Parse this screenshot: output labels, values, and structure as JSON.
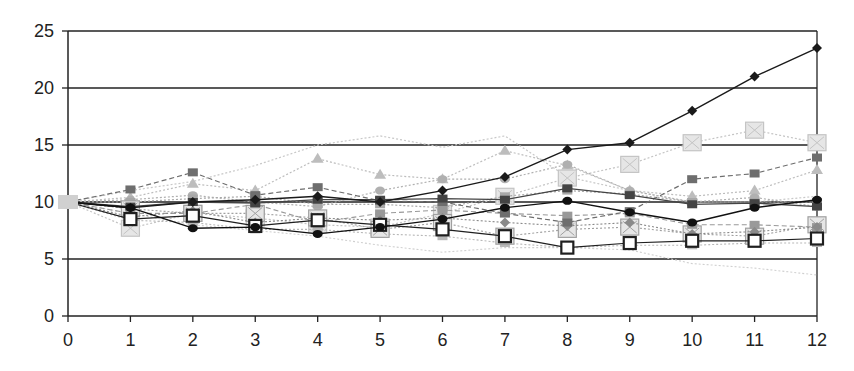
{
  "chart_data": {
    "type": "line",
    "title": "",
    "xlabel": "",
    "ylabel": "",
    "x": [
      0,
      1,
      2,
      3,
      4,
      5,
      6,
      7,
      8,
      9,
      10,
      11,
      12
    ],
    "xlim": [
      0,
      12
    ],
    "ylim": [
      0,
      25
    ],
    "yticks": [
      0,
      5,
      10,
      15,
      20,
      25
    ],
    "xticks": [
      0,
      1,
      2,
      3,
      4,
      5,
      6,
      7,
      8,
      9,
      10,
      11,
      12
    ],
    "grid": {
      "horizontal": true,
      "vertical": false
    },
    "legend": null,
    "series": [
      {
        "name": "series-1",
        "marker": "diamond",
        "color": "#1a1a1a",
        "dash": "solid",
        "width": 1.4,
        "values": [
          10,
          9.5,
          10.0,
          10.2,
          10.5,
          10.0,
          11.0,
          12.2,
          14.6,
          15.2,
          18.0,
          21.0,
          23.5
        ]
      },
      {
        "name": "series-2",
        "marker": "none",
        "color": "#c8c8c8",
        "dash": "dotted",
        "width": 1.2,
        "values": [
          10,
          11.0,
          11.8,
          13.2,
          15.0,
          15.8,
          14.8,
          15.8,
          12.2,
          11.0,
          10.0,
          10.0,
          10.5
        ]
      },
      {
        "name": "series-3",
        "marker": "xsquare",
        "color": "#c4c4c4",
        "dash": "dotted",
        "width": 1.2,
        "values": [
          10,
          7.7,
          9.0,
          8.6,
          8.0,
          7.8,
          9.0,
          10.5,
          12.1,
          13.3,
          15.2,
          16.3,
          15.2
        ]
      },
      {
        "name": "series-4",
        "marker": "square",
        "color": "#6e6e6e",
        "dash": "dashed",
        "width": 1.2,
        "values": [
          10,
          11.1,
          12.6,
          10.6,
          11.3,
          10.1,
          10.0,
          9.0,
          8.2,
          9.2,
          12.0,
          12.5,
          13.9
        ]
      },
      {
        "name": "series-5",
        "marker": "triangle",
        "color": "#bdbdbd",
        "dash": "dotted",
        "width": 1.2,
        "values": [
          10,
          10.4,
          11.6,
          11.0,
          13.8,
          12.4,
          12.0,
          14.5,
          13.2,
          11.0,
          10.5,
          11.0,
          12.8
        ]
      },
      {
        "name": "series-6",
        "marker": "circle",
        "color": "#111111",
        "dash": "solid",
        "width": 1.4,
        "values": [
          10,
          9.5,
          7.7,
          7.8,
          7.2,
          7.8,
          8.5,
          9.5,
          10.1,
          9.1,
          8.2,
          9.5,
          10.2
        ]
      },
      {
        "name": "series-7",
        "marker": "opensquare",
        "color": "#1f1f1f",
        "dash": "solid",
        "width": 1.2,
        "values": [
          10,
          8.5,
          8.8,
          7.9,
          8.4,
          8.0,
          7.6,
          7.0,
          6.0,
          6.4,
          6.6,
          6.6,
          6.8
        ]
      },
      {
        "name": "series-8",
        "marker": "square",
        "color": "#a8a8a8",
        "dash": "dotted",
        "width": 1.2,
        "values": [
          10,
          10.0,
          10.3,
          10.5,
          9.8,
          9.8,
          9.5,
          10.5,
          11.0,
          10.7,
          10.0,
          10.0,
          10.0
        ]
      },
      {
        "name": "series-9",
        "marker": "circle",
        "color": "#b0b0b0",
        "dash": "dotted",
        "width": 1.2,
        "values": [
          10,
          10.2,
          10.6,
          10.0,
          9.6,
          11.0,
          12.0,
          12.0,
          13.3,
          11.0,
          10.0,
          10.4,
          9.6
        ]
      },
      {
        "name": "series-10",
        "marker": "square",
        "color": "#444444",
        "dash": "solid",
        "width": 1.3,
        "values": [
          10,
          9.6,
          10.0,
          9.9,
          10.2,
          10.2,
          10.3,
          10.2,
          11.2,
          10.6,
          9.8,
          9.9,
          9.6
        ]
      },
      {
        "name": "series-11",
        "marker": "square",
        "color": "#999999",
        "dash": "dashed",
        "width": 1.1,
        "values": [
          10,
          9.0,
          9.0,
          9.8,
          8.2,
          9.0,
          9.3,
          9.0,
          8.8,
          9.0,
          8.0,
          8.0,
          7.8
        ]
      },
      {
        "name": "series-12",
        "marker": "diamond",
        "color": "#8a8a8a",
        "dash": "dotted",
        "width": 1.1,
        "values": [
          10,
          8.7,
          9.2,
          8.2,
          8.6,
          8.4,
          8.6,
          8.2,
          7.9,
          8.2,
          7.2,
          7.4,
          7.8
        ]
      },
      {
        "name": "series-13",
        "marker": "square",
        "color": "#b8b8b8",
        "dash": "dotted",
        "width": 1.1,
        "values": [
          10,
          8.4,
          8.2,
          7.6,
          7.6,
          7.2,
          7.0,
          6.4,
          6.0,
          6.2,
          6.2,
          6.4,
          6.4
        ]
      },
      {
        "name": "series-14",
        "marker": "none",
        "color": "#d0d0d0",
        "dash": "dotted",
        "width": 1.1,
        "values": [
          10,
          9.0,
          8.0,
          7.5,
          7.0,
          6.2,
          5.6,
          6.0,
          6.0,
          5.8,
          4.6,
          4.2,
          3.6
        ]
      },
      {
        "name": "series-15",
        "marker": "xsquare",
        "color": "#a0a0a0",
        "dash": "dotted",
        "width": 1.1,
        "values": [
          10,
          9.4,
          9.0,
          9.0,
          8.6,
          7.6,
          8.2,
          7.0,
          7.6,
          7.8,
          7.2,
          7.0,
          8.0
        ]
      }
    ]
  },
  "axes": {
    "y_tick_labels": [
      "0",
      "5",
      "10",
      "15",
      "20",
      "25"
    ],
    "x_tick_labels": [
      "0",
      "1",
      "2",
      "3",
      "4",
      "5",
      "6",
      "7",
      "8",
      "9",
      "10",
      "11",
      "12"
    ]
  }
}
